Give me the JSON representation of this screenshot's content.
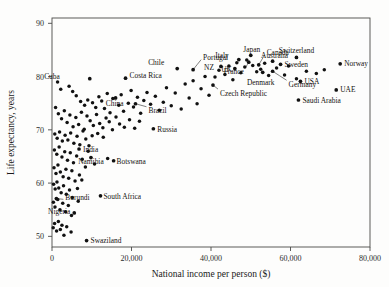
{
  "figure": {
    "background_color": "#fdfdfc",
    "point_color": "#111111",
    "axis_color": "#4a4a48"
  },
  "chart_data": {
    "type": "scatter",
    "title": "",
    "xlabel": "National income per person ($)",
    "ylabel": "Life expectancy, years",
    "xlim": [
      0,
      80000
    ],
    "ylim": [
      48,
      91
    ],
    "xticks": [
      0,
      20000,
      40000,
      60000,
      80000
    ],
    "xticklabels": [
      "0",
      "20,000",
      "40,000",
      "60,000",
      "80,000"
    ],
    "yticks": [
      50,
      60,
      70,
      80,
      90
    ],
    "yticklabels": [
      "50",
      "60",
      "70",
      "80",
      "90"
    ],
    "grid": false,
    "legend": "none",
    "labeled_points": [
      {
        "name": "Cuba",
        "x": 9500,
        "y": 79.6,
        "label_dx": -30,
        "label_dy": 2.4,
        "anchor": "end",
        "leader": false
      },
      {
        "name": "Costa Rica",
        "x": 18500,
        "y": 79.7,
        "label_dx": 4,
        "label_dy": 2.4,
        "anchor": "start",
        "leader": false
      },
      {
        "name": "China",
        "x": 16000,
        "y": 76.0,
        "label_dx": -1,
        "label_dy": -6,
        "anchor": "middle",
        "leader": true
      },
      {
        "name": "Brazil",
        "x": 21000,
        "y": 74.9,
        "label_dx": 13,
        "label_dy": -7,
        "anchor": "start",
        "leader": true
      },
      {
        "name": "Chile",
        "x": 31500,
        "y": 81.5,
        "label_dx": -13,
        "label_dy": 6,
        "anchor": "end",
        "leader": false
      },
      {
        "name": "Portugal",
        "x": 35500,
        "y": 81.3,
        "label_dx": 10,
        "label_dy": 12,
        "anchor": "start",
        "leader": true
      },
      {
        "name": "Italy",
        "x": 47000,
        "y": 83.2,
        "label_dx": -10,
        "label_dy": 4,
        "anchor": "end",
        "leader": false
      },
      {
        "name": "Japan",
        "x": 50000,
        "y": 84.0,
        "label_dx": 1,
        "label_dy": 6,
        "anchor": "middle",
        "leader": false
      },
      {
        "name": "NZ",
        "x": 42500,
        "y": 81.9,
        "label_dx": -7,
        "label_dy": -1,
        "anchor": "end",
        "leader": false
      },
      {
        "name": "UK",
        "x": 46000,
        "y": 81.5,
        "label_dx": -3,
        "label_dy": -1,
        "anchor": "end",
        "leader": false
      },
      {
        "name": "France",
        "x": 49500,
        "y": 82.7,
        "label_dx": -5,
        "label_dy": -9,
        "anchor": "end",
        "leader": true
      },
      {
        "name": "Czech Republic",
        "x": 40500,
        "y": 78.4,
        "label_dx": 7,
        "label_dy": -8,
        "anchor": "start",
        "leader": true
      },
      {
        "name": "Canada",
        "x": 52000,
        "y": 82.2,
        "label_dx": 8,
        "label_dy": 12,
        "anchor": "start",
        "leader": true
      },
      {
        "name": "Australia",
        "x": 55500,
        "y": 82.9,
        "label_dx": 2,
        "label_dy": 6,
        "anchor": "middle",
        "leader": false
      },
      {
        "name": "Sweden",
        "x": 57500,
        "y": 82.3,
        "label_dx": 4,
        "label_dy": 0,
        "anchor": "start",
        "leader": false
      },
      {
        "name": "Denmark",
        "x": 53000,
        "y": 80.8,
        "label_dx": -2,
        "label_dy": -10,
        "anchor": "middle",
        "leader": false
      },
      {
        "name": "Germany",
        "x": 55500,
        "y": 81.0,
        "label_dx": 16,
        "label_dy": -13,
        "anchor": "start",
        "leader": true
      },
      {
        "name": "USA",
        "x": 62500,
        "y": 79.1,
        "label_dx": 4,
        "label_dy": 0,
        "anchor": "start",
        "leader": false
      },
      {
        "name": "Saudi Arabia",
        "x": 62000,
        "y": 75.6,
        "label_dx": 4,
        "label_dy": 0,
        "anchor": "start",
        "leader": false
      },
      {
        "name": "Switzerland",
        "x": 61500,
        "y": 83.6,
        "label_dx": 0,
        "label_dy": 7,
        "anchor": "middle",
        "leader": false
      },
      {
        "name": "Norway",
        "x": 72500,
        "y": 82.4,
        "label_dx": 4,
        "label_dy": 0,
        "anchor": "start",
        "leader": false
      },
      {
        "name": "UAE",
        "x": 71500,
        "y": 77.5,
        "label_dx": 4,
        "label_dy": 0,
        "anchor": "start",
        "leader": false
      },
      {
        "name": "Russia",
        "x": 25500,
        "y": 70.2,
        "label_dx": 4,
        "label_dy": -0.2,
        "anchor": "start",
        "leader": false
      },
      {
        "name": "India",
        "x": 6800,
        "y": 66.4,
        "label_dx": 4,
        "label_dy": 0,
        "anchor": "start",
        "leader": false
      },
      {
        "name": "Namibia",
        "x": 9800,
        "y": 64.8,
        "label_dx": 0,
        "label_dy": -4.3,
        "anchor": "middle",
        "leader": true
      },
      {
        "name": "Botswana",
        "x": 15500,
        "y": 64.2,
        "label_dx": 3,
        "label_dy": -0.6,
        "anchor": "start",
        "leader": false
      },
      {
        "name": "Burundi",
        "x": 1100,
        "y": 57.1,
        "label_dx": 9,
        "label_dy": 1.2,
        "anchor": "start",
        "leader": true
      },
      {
        "name": "South Africa",
        "x": 12200,
        "y": 57.6,
        "label_dx": 3,
        "label_dy": -0.8,
        "anchor": "start",
        "leader": false
      },
      {
        "name": "Nigeria",
        "x": 5600,
        "y": 54.4,
        "label_dx": -4,
        "label_dy": 1.4,
        "anchor": "end",
        "leader": false
      },
      {
        "name": "Swaziland",
        "x": 8700,
        "y": 49.2,
        "label_dx": 4,
        "label_dy": 0,
        "anchor": "start",
        "leader": false
      }
    ],
    "unlabeled_points": [
      [
        1400,
        79.0
      ],
      [
        2200,
        77.6
      ],
      [
        4300,
        78.2
      ],
      [
        5200,
        77.2
      ],
      [
        6100,
        76.4
      ],
      [
        7200,
        75.3
      ],
      [
        8200,
        74.6
      ],
      [
        9000,
        75.6
      ],
      [
        10200,
        75.1
      ],
      [
        11000,
        74.2
      ],
      [
        11800,
        76.2
      ],
      [
        12500,
        75.4
      ],
      [
        13200,
        74.0
      ],
      [
        13900,
        76.8
      ],
      [
        14600,
        73.2
      ],
      [
        15300,
        75.9
      ],
      [
        16800,
        74.6
      ],
      [
        17400,
        76.6
      ],
      [
        18000,
        73.5
      ],
      [
        19200,
        75.0
      ],
      [
        19900,
        77.4
      ],
      [
        20500,
        74.3
      ],
      [
        21500,
        76.1
      ],
      [
        22300,
        73.1
      ],
      [
        23100,
        75.5
      ],
      [
        23900,
        77.0
      ],
      [
        24800,
        74.8
      ],
      [
        26000,
        76.3
      ],
      [
        27000,
        73.7
      ],
      [
        28000,
        75.2
      ],
      [
        28800,
        77.9
      ],
      [
        30000,
        74.5
      ],
      [
        31000,
        76.9
      ],
      [
        32500,
        73.9
      ],
      [
        33500,
        78.6
      ],
      [
        34500,
        76.0
      ],
      [
        35500,
        79.2
      ],
      [
        36500,
        74.9
      ],
      [
        37500,
        77.7
      ],
      [
        38500,
        80.0
      ],
      [
        39500,
        76.5
      ],
      [
        41000,
        79.9
      ],
      [
        42000,
        81.2
      ],
      [
        43500,
        80.4
      ],
      [
        44500,
        82.0
      ],
      [
        45500,
        79.4
      ],
      [
        46500,
        82.6
      ],
      [
        47500,
        80.7
      ],
      [
        48500,
        81.8
      ],
      [
        49000,
        83.1
      ],
      [
        50500,
        82.1
      ],
      [
        51500,
        80.9
      ],
      [
        52500,
        81.4
      ],
      [
        53500,
        82.5
      ],
      [
        54500,
        80.2
      ],
      [
        56500,
        81.6
      ],
      [
        58500,
        80.3
      ],
      [
        59500,
        82.0
      ],
      [
        61500,
        79.6
      ],
      [
        64000,
        81.0
      ],
      [
        66500,
        80.6
      ],
      [
        68500,
        81.3
      ],
      [
        900,
        74.2
      ],
      [
        1600,
        73.0
      ],
      [
        2400,
        72.1
      ],
      [
        3100,
        73.6
      ],
      [
        3800,
        71.4
      ],
      [
        4500,
        72.8
      ],
      [
        5300,
        70.6
      ],
      [
        6000,
        72.3
      ],
      [
        6700,
        71.0
      ],
      [
        7400,
        73.3
      ],
      [
        8100,
        70.1
      ],
      [
        8800,
        72.6
      ],
      [
        9600,
        71.7
      ],
      [
        10400,
        70.8
      ],
      [
        11200,
        72.9
      ],
      [
        12000,
        71.2
      ],
      [
        12800,
        70.4
      ],
      [
        13600,
        72.2
      ],
      [
        14400,
        71.5
      ],
      [
        15200,
        70.0
      ],
      [
        16100,
        72.4
      ],
      [
        17000,
        71.1
      ],
      [
        18200,
        70.5
      ],
      [
        19500,
        71.9
      ],
      [
        20800,
        70.3
      ],
      [
        22000,
        71.6
      ],
      [
        700,
        69.2
      ],
      [
        1300,
        68.4
      ],
      [
        1900,
        69.6
      ],
      [
        2600,
        67.9
      ],
      [
        3300,
        69.0
      ],
      [
        4000,
        68.1
      ],
      [
        4700,
        69.4
      ],
      [
        5500,
        67.5
      ],
      [
        6300,
        68.8
      ],
      [
        7000,
        67.2
      ],
      [
        7800,
        69.8
      ],
      [
        8500,
        68.3
      ],
      [
        9300,
        67.0
      ],
      [
        10100,
        68.9
      ],
      [
        11500,
        69.3
      ],
      [
        12900,
        68.6
      ],
      [
        600,
        66.2
      ],
      [
        1200,
        65.4
      ],
      [
        1800,
        66.8
      ],
      [
        2500,
        64.9
      ],
      [
        3200,
        65.9
      ],
      [
        3900,
        64.3
      ],
      [
        4600,
        65.7
      ],
      [
        5400,
        63.8
      ],
      [
        6200,
        65.1
      ],
      [
        7600,
        64.5
      ],
      [
        9100,
        66.0
      ],
      [
        14000,
        64.6
      ],
      [
        500,
        62.9
      ],
      [
        1000,
        61.8
      ],
      [
        1500,
        63.4
      ],
      [
        2100,
        62.1
      ],
      [
        2800,
        61.2
      ],
      [
        3500,
        62.6
      ],
      [
        4200,
        60.9
      ],
      [
        5000,
        62.3
      ],
      [
        5800,
        60.4
      ],
      [
        6900,
        61.5
      ],
      [
        8400,
        63.0
      ],
      [
        10700,
        63.6
      ],
      [
        400,
        59.8
      ],
      [
        800,
        58.9
      ],
      [
        1250,
        60.2
      ],
      [
        1700,
        59.1
      ],
      [
        2300,
        58.2
      ],
      [
        2900,
        59.5
      ],
      [
        3600,
        57.9
      ],
      [
        4400,
        58.7
      ],
      [
        5100,
        57.3
      ],
      [
        6400,
        59.0
      ],
      [
        7500,
        60.6
      ],
      [
        350,
        56.4
      ],
      [
        750,
        55.5
      ],
      [
        1450,
        56.9
      ],
      [
        2000,
        55.0
      ],
      [
        2700,
        56.2
      ],
      [
        3400,
        54.6
      ],
      [
        4100,
        55.8
      ],
      [
        4900,
        53.9
      ],
      [
        6600,
        56.6
      ],
      [
        300,
        51.6
      ],
      [
        650,
        52.4
      ],
      [
        1150,
        51.0
      ],
      [
        1600,
        52.8
      ],
      [
        2100,
        51.3
      ],
      [
        2500,
        52.1
      ],
      [
        3000,
        50.2
      ],
      [
        3700,
        51.8
      ],
      [
        4800,
        50.8
      ]
    ]
  }
}
